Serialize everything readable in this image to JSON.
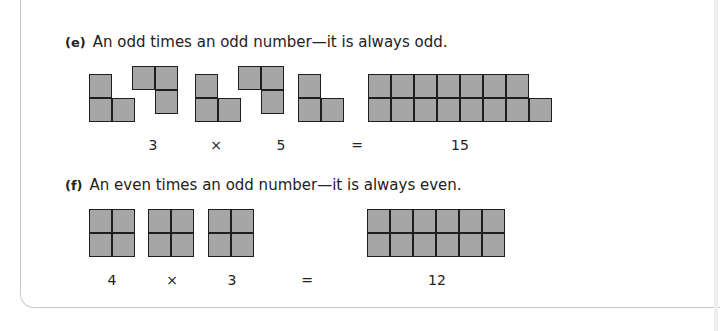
{
  "colors": {
    "cell_fill": "#a6a6a6",
    "cell_border": "#1e1e1e",
    "card_border": "#c8c8c8"
  },
  "questions": [
    {
      "label": "(e)",
      "text": "An odd times an odd number—it is always odd.",
      "equation": [
        "3",
        "×",
        "5",
        "=",
        "15"
      ],
      "shapes": [
        {
          "name": "l-shape-3",
          "cells": 3
        },
        {
          "name": "reverse-l-shape-3",
          "cells": 3
        },
        {
          "name": "l-shape-3",
          "cells": 3
        },
        {
          "name": "reverse-l-shape-3",
          "cells": 3
        },
        {
          "name": "l-shape-3",
          "cells": 3
        },
        {
          "name": "product-shape-15",
          "cells": 15
        }
      ]
    },
    {
      "label": "(f)",
      "text": "An even times an odd number—it is always even.",
      "equation": [
        "4",
        "×",
        "3",
        "=",
        "12"
      ],
      "shapes": [
        {
          "name": "square-shape-4",
          "cells": 4
        },
        {
          "name": "square-shape-4",
          "cells": 4
        },
        {
          "name": "square-shape-4",
          "cells": 4
        },
        {
          "name": "product-shape-12",
          "cells": 12
        }
      ]
    }
  ]
}
